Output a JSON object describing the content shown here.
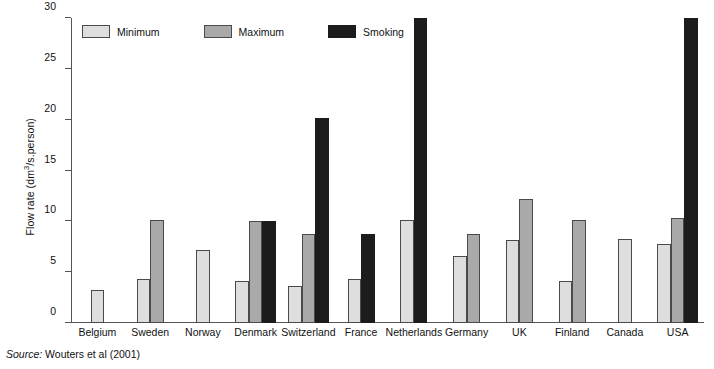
{
  "chart_data": {
    "type": "bar",
    "title": "",
    "xlabel": "",
    "ylabel": "Flow rate (dm3/s.person)",
    "ylabel_parts": {
      "prefix": "Flow rate (dm",
      "sup": "3",
      "suffix": "/s.person)"
    },
    "ylim": [
      0,
      30
    ],
    "yticks": [
      0,
      5,
      10,
      15,
      20,
      25,
      30
    ],
    "ytick_labels": [
      "0",
      "5",
      "10",
      "15",
      "20",
      "25",
      "30"
    ],
    "grid": false,
    "legend_position": "top-left",
    "categories": [
      "Belgium",
      "Sweden",
      "Norway",
      "Denmark",
      "Switzerland",
      "France",
      "Netherlands",
      "Germany",
      "UK",
      "Finland",
      "Canada",
      "USA"
    ],
    "series": [
      {
        "name": "Minimum",
        "color": "#dedede",
        "values": [
          3.2,
          4.3,
          7.2,
          4.1,
          3.6,
          4.3,
          10.1,
          6.6,
          8.2,
          4.1,
          8.3,
          7.8
        ]
      },
      {
        "name": "Maximum",
        "color": "#a9a9a9",
        "values": [
          null,
          10.1,
          null,
          10.0,
          8.8,
          null,
          null,
          8.8,
          12.2,
          10.1,
          null,
          10.3
        ]
      },
      {
        "name": "Smoking",
        "color": "#1c1c1c",
        "values": [
          null,
          null,
          null,
          10.0,
          20.2,
          8.8,
          30.0,
          null,
          null,
          null,
          null,
          30.0
        ]
      }
    ]
  },
  "legend": {
    "items": [
      {
        "label": "Minimum",
        "key": "minimum"
      },
      {
        "label": "Maximum",
        "key": "maximum"
      },
      {
        "label": "Smoking",
        "key": "smoking"
      }
    ]
  },
  "source": {
    "label": "Source:",
    "text": "Wouters et al (2001)"
  }
}
